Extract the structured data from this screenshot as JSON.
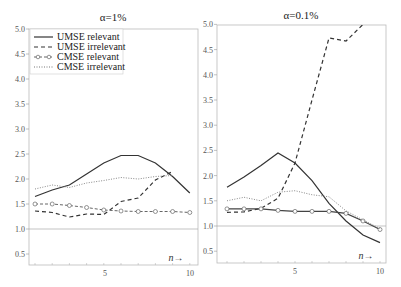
{
  "chart_data": [
    {
      "type": "line",
      "title": "α=1%",
      "xlabel": "n→",
      "ylabel": "",
      "x": [
        1,
        2,
        3,
        4,
        5,
        6,
        7,
        8,
        9,
        10
      ],
      "xticks": [
        "5",
        "10"
      ],
      "yticks": [
        "0.5",
        "1.0",
        "1.5",
        "2.0",
        "2.5",
        "3.0",
        "3.5",
        "4.0",
        "4.5",
        "5.0"
      ],
      "ylim": [
        0.4,
        5.0
      ],
      "xlim": [
        0.7,
        10.5
      ],
      "reference_line": 1.0,
      "grid": false,
      "legend_position": "upper left",
      "series": [
        {
          "name": "UMSE relevant",
          "style": "solid",
          "values": [
            1.65,
            1.78,
            1.88,
            2.1,
            2.32,
            2.47,
            2.47,
            2.32,
            2.05,
            1.72
          ]
        },
        {
          "name": "UMSE irrelevant",
          "style": "dashed",
          "values": [
            1.36,
            1.33,
            1.24,
            1.3,
            1.29,
            1.55,
            1.62,
            1.98,
            2.15,
            null
          ]
        },
        {
          "name": "CMSE relevant",
          "style": "dashed-circle",
          "values": [
            1.5,
            1.5,
            1.47,
            1.43,
            1.38,
            1.36,
            1.35,
            1.35,
            1.35,
            1.33
          ]
        },
        {
          "name": "CMSE irrelevant",
          "style": "dotted",
          "values": [
            1.8,
            1.88,
            1.83,
            1.92,
            1.97,
            2.03,
            2.0,
            2.05,
            2.07,
            null
          ]
        }
      ]
    },
    {
      "type": "line",
      "title": "α=0.1%",
      "xlabel": "n→",
      "ylabel": "",
      "x": [
        1,
        2,
        3,
        4,
        5,
        6,
        7,
        8,
        9,
        10
      ],
      "xticks": [
        "5",
        "10"
      ],
      "yticks": [
        "0.5",
        "1.0",
        "1.5",
        "2.0",
        "2.5",
        "3.0",
        "3.5",
        "4.0",
        "4.5",
        "5.0"
      ],
      "ylim": [
        0.4,
        5.0
      ],
      "xlim": [
        0.4,
        10.4
      ],
      "reference_line": 1.0,
      "grid": false,
      "series": [
        {
          "name": "UMSE relevant",
          "style": "solid",
          "values": [
            1.77,
            1.97,
            2.2,
            2.45,
            2.25,
            1.9,
            1.45,
            1.1,
            0.82,
            0.67
          ]
        },
        {
          "name": "UMSE irrelevant",
          "style": "dashed",
          "values": [
            1.27,
            1.28,
            1.35,
            1.55,
            2.25,
            3.5,
            4.73,
            4.67,
            5.0,
            null
          ]
        },
        {
          "name": "CMSE relevant",
          "style": "solid-circle",
          "values": [
            1.34,
            1.34,
            1.34,
            1.31,
            1.29,
            1.29,
            1.29,
            1.25,
            1.1,
            0.93
          ]
        },
        {
          "name": "CMSE irrelevant",
          "style": "dotted",
          "values": [
            1.5,
            1.57,
            1.5,
            1.67,
            1.7,
            1.62,
            1.58,
            1.3,
            1.12,
            0.95
          ]
        }
      ]
    }
  ],
  "panels": [
    {
      "title": "α=1%",
      "xlabel": "n→",
      "xtick_5": "5",
      "xtick_10": "10"
    },
    {
      "title": "α=0.1%",
      "xlabel": "n→",
      "xtick_5": "5",
      "xtick_10": "10"
    }
  ],
  "yticks": [
    "0.5",
    "1.0",
    "1.5",
    "2.0",
    "2.5",
    "3.0",
    "3.5",
    "4.0",
    "4.5",
    "5.0"
  ],
  "legend": [
    {
      "label": "UMSE relevant"
    },
    {
      "label": "UMSE irrelevant"
    },
    {
      "label": "CMSE relevant"
    },
    {
      "label": "CMSE irrelevant"
    }
  ]
}
